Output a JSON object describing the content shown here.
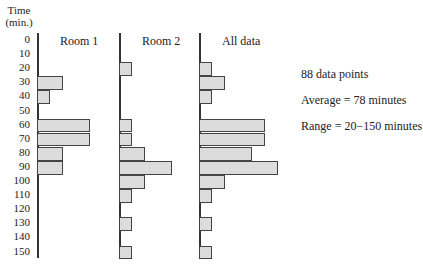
{
  "chart_data": {
    "type": "bar",
    "orientation": "horizontal-histogram",
    "ylabel": "Time (min.)",
    "y_ticks": [
      0,
      10,
      20,
      30,
      40,
      50,
      60,
      70,
      80,
      90,
      100,
      110,
      120,
      130,
      140,
      150
    ],
    "panels": [
      {
        "title": "Room 1",
        "bins": [
          30,
          40,
          60,
          70,
          80,
          90
        ],
        "widths_units": [
          2,
          1,
          4,
          4,
          2,
          2
        ]
      },
      {
        "title": "Room 2",
        "bins": [
          20,
          60,
          70,
          80,
          90,
          100,
          110,
          130,
          150
        ],
        "widths_units": [
          1,
          1,
          1,
          2,
          4,
          2,
          1,
          1,
          1
        ]
      },
      {
        "title": "All data",
        "bins": [
          20,
          30,
          40,
          60,
          70,
          80,
          90,
          100,
          110,
          130,
          150
        ],
        "widths_units": [
          1,
          2,
          1,
          5,
          5,
          4,
          6,
          2,
          1,
          1,
          1
        ]
      }
    ],
    "annotations": [
      "88 data points",
      "Average = 78 minutes",
      "Range = 20−150 minutes"
    ]
  },
  "axis": {
    "title_line1": "Time",
    "title_line2": "(min.)"
  },
  "panels": {
    "p1": "Room 1",
    "p2": "Room 2",
    "p3": "All data"
  },
  "stats": {
    "count": "88 data points",
    "average": "Average = 78 minutes",
    "range": "Range = 20−150 minutes"
  }
}
